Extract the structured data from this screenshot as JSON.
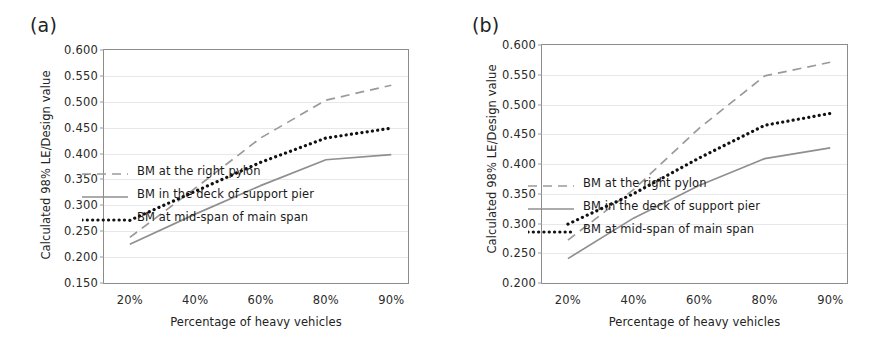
{
  "figure": {
    "panels": [
      {
        "label": "(a)",
        "chart_data": {
          "type": "line",
          "title": "",
          "xlabel": "Percentage of heavy vehicles",
          "ylabel": "Calculated 98% LE/Design value",
          "categories": [
            "20%",
            "40%",
            "60%",
            "80%",
            "90%"
          ],
          "ylim": [
            0.15,
            0.6
          ],
          "yticks": [
            "0.600",
            "0.550",
            "0.500",
            "0.450",
            "0.400",
            "0.350",
            "0.300",
            "0.250",
            "0.200",
            "0.150"
          ],
          "grid": true,
          "legend_position": "center",
          "series": [
            {
              "name": "BM at the right pylon",
              "style": "dashed",
              "color": "#9a9a9a",
              "values": [
                0.238,
                0.333,
                0.43,
                0.503,
                0.532
              ]
            },
            {
              "name": "BM in the deck of support pier",
              "style": "solid",
              "color": "#8f8f8f",
              "values": [
                0.225,
                0.283,
                0.338,
                0.388,
                0.398
              ]
            },
            {
              "name": "BM at mid-span of main span",
              "style": "dotted",
              "color": "#111111",
              "values": [
                0.271,
                0.327,
                0.383,
                0.43,
                0.449
              ]
            }
          ]
        }
      },
      {
        "label": "(b)",
        "chart_data": {
          "type": "line",
          "title": "",
          "xlabel": "Percentage of heavy vehicles",
          "ylabel": "Calculated 98% LE/Design value",
          "categories": [
            "20%",
            "40%",
            "60%",
            "80%",
            "90%"
          ],
          "ylim": [
            0.2,
            0.6
          ],
          "yticks": [
            "0.600",
            "0.550",
            "0.500",
            "0.450",
            "0.400",
            "0.350",
            "0.300",
            "0.250",
            "0.200"
          ],
          "grid": true,
          "legend_position": "center",
          "series": [
            {
              "name": "BM at the right pylon",
              "style": "dashed",
              "color": "#9a9a9a",
              "values": [
                0.272,
                0.357,
                0.46,
                0.548,
                0.571
              ]
            },
            {
              "name": "BM in the deck of support pier",
              "style": "solid",
              "color": "#8f8f8f",
              "values": [
                0.241,
                0.309,
                0.364,
                0.409,
                0.427
              ]
            },
            {
              "name": "BM at mid-span of main span",
              "style": "dotted",
              "color": "#111111",
              "values": [
                0.299,
                0.35,
                0.41,
                0.465,
                0.485
              ]
            }
          ]
        }
      }
    ]
  }
}
